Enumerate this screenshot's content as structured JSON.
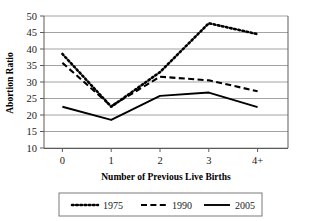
{
  "chart_data": {
    "type": "line",
    "title": "",
    "xlabel": "Number of Previous Live Births",
    "ylabel": "Abortion Ratio",
    "categories": [
      "0",
      "1",
      "2",
      "3",
      "4+"
    ],
    "ylim": [
      10,
      50
    ],
    "yticks": [
      10,
      15,
      20,
      25,
      30,
      35,
      40,
      45,
      50
    ],
    "grid": true,
    "legend_position": "bottom",
    "series": [
      {
        "name": "1975",
        "style": "dotted",
        "values": [
          38.5,
          22.5,
          33.0,
          47.8,
          44.5
        ]
      },
      {
        "name": "1990",
        "style": "dashed",
        "values": [
          35.8,
          22.7,
          31.6,
          30.5,
          27.2
        ]
      },
      {
        "name": "2005",
        "style": "solid",
        "values": [
          22.5,
          18.5,
          25.8,
          26.8,
          22.4
        ]
      }
    ]
  },
  "axes": {
    "y_label": "Abortion Ratio",
    "x_label": "Number of Previous Live Births",
    "y_tick_labels": [
      "50",
      "45",
      "40",
      "35",
      "30",
      "25",
      "20",
      "15",
      "10"
    ],
    "x_tick_labels": [
      "0",
      "1",
      "2",
      "3",
      "4+"
    ]
  },
  "legend": {
    "entries": [
      {
        "label": "1975",
        "style": "dotted"
      },
      {
        "label": "1990",
        "style": "dashed"
      },
      {
        "label": "2005",
        "style": "solid"
      }
    ]
  },
  "colors": {
    "line": "#000000",
    "grid": "#8a8a8a",
    "axis": "#5a5a5a",
    "text": "#1a1a1a",
    "background": "#ffffff"
  }
}
